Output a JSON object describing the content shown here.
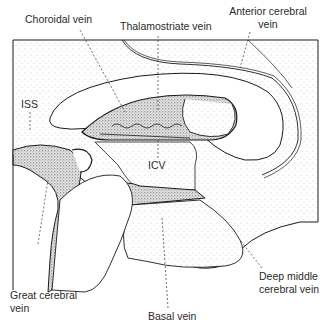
{
  "diagram": {
    "type": "anatomical-illustration",
    "labels": {
      "choroidal_vein": "Choroidal vein",
      "thalamostriate_vein": "Thalamostriate vein",
      "anterior_cerebral_vein_line1": "Anterior cerebral",
      "anterior_cerebral_vein_line2": "vein",
      "iss": "ISS",
      "icv": "ICV",
      "great_cerebral_vein_line1": "Great cerebral",
      "great_cerebral_vein_line2": "vein",
      "basal_vein": "Basal vein",
      "deep_middle_cerebral_vein_line1": "Deep middle",
      "deep_middle_cerebral_vein_line2": "cerebral vein"
    },
    "colors": {
      "ink": "#1a1a1a",
      "stipple": "#9a9a9a",
      "background": "#ffffff"
    }
  }
}
